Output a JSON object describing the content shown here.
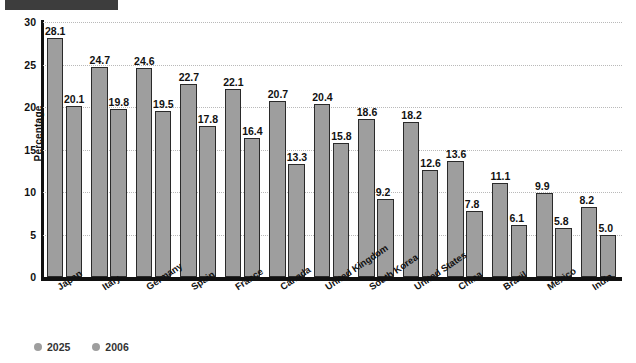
{
  "redaction": {
    "present": true,
    "color": "#3d3d3d"
  },
  "legend": {
    "position": "bottom-left",
    "entries": [
      {
        "label": "2025",
        "color": "#9e9e9e"
      },
      {
        "label": "2006",
        "color": "#9e9e9e"
      }
    ]
  },
  "axis": {
    "y_title": "Percentage",
    "y_ticks": [
      "0",
      "5",
      "10",
      "15",
      "20",
      "25",
      "30"
    ]
  },
  "colors": {
    "bar_fill": "#9e9e9e",
    "bar_stroke": "#2a2a2a",
    "axis": "#111111",
    "gridline": "#b9b9b9",
    "redaction": "#3d3d3d"
  },
  "chart_data": {
    "type": "bar",
    "title": "",
    "xlabel": "",
    "ylabel": "Percentage",
    "ylim": [
      0,
      30
    ],
    "ytick_step": 5,
    "grid": true,
    "legend_position": "bottom-left",
    "categories": [
      "Japan",
      "Italy",
      "Germany",
      "Spain",
      "France",
      "Canada",
      "United Kingdom",
      "South Korea",
      "United States",
      "China",
      "Brazil",
      "Mexico",
      "India"
    ],
    "series": [
      {
        "name": "2025",
        "values": [
          28.1,
          24.7,
          24.6,
          22.7,
          22.1,
          20.7,
          20.4,
          18.6,
          18.2,
          13.6,
          11.1,
          9.9,
          8.2
        ]
      },
      {
        "name": "2006",
        "values": [
          20.1,
          19.8,
          19.5,
          17.8,
          16.4,
          13.3,
          15.8,
          9.2,
          12.6,
          7.8,
          6.1,
          5.8,
          5.0
        ]
      }
    ]
  }
}
